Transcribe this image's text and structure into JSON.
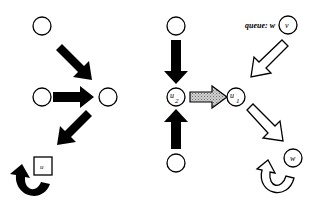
{
  "diagram": {
    "panels": [
      {
        "id": "left",
        "nodes": [
          {
            "id": "top",
            "label": ""
          },
          {
            "id": "mid-left",
            "label": ""
          },
          {
            "id": "mid-right",
            "label": ""
          },
          {
            "id": "u-square",
            "label": "u",
            "shape": "square"
          }
        ],
        "arrows": [
          {
            "from": "top",
            "to": "mid-right",
            "style": "solid-black"
          },
          {
            "from": "mid-left",
            "to": "mid-right",
            "style": "solid-black"
          },
          {
            "from": "mid-right",
            "to": "u-square",
            "style": "solid-black"
          },
          {
            "from": "u-square",
            "to": "u-square",
            "style": "solid-black-self-loop"
          }
        ]
      },
      {
        "id": "middle",
        "nodes": [
          {
            "id": "top",
            "label": ""
          },
          {
            "id": "u2",
            "label": "u",
            "subscript": "2"
          },
          {
            "id": "bottom",
            "label": ""
          },
          {
            "id": "u1",
            "label": "u",
            "subscript": "1"
          }
        ],
        "arrows": [
          {
            "from": "top",
            "to": "u2",
            "style": "solid-black"
          },
          {
            "from": "bottom",
            "to": "u2",
            "style": "solid-black"
          },
          {
            "from": "u2",
            "to": "u1",
            "style": "gray-hatched"
          }
        ]
      },
      {
        "id": "right",
        "queue_label": "queue: w",
        "nodes": [
          {
            "id": "v",
            "label": "v"
          },
          {
            "id": "w",
            "label": "w"
          }
        ],
        "arrows": [
          {
            "from": "v",
            "to": "u1",
            "style": "hollow"
          },
          {
            "from": "u1",
            "to": "w",
            "style": "hollow"
          },
          {
            "from": "w",
            "to": "w",
            "style": "hollow-self-loop"
          }
        ]
      }
    ],
    "colors": {
      "stroke": "#000000",
      "hatch": "#b0b0b0",
      "background": "#ffffff"
    }
  }
}
